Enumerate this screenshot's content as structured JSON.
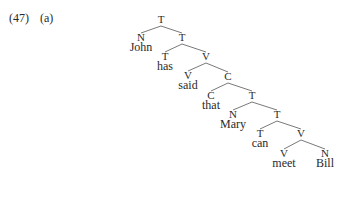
{
  "example": {
    "number": "(47)",
    "sub": "(a)"
  },
  "tree": {
    "nodes": [
      {
        "id": "n0",
        "label": "T",
        "word": null,
        "x": 161,
        "y": 23,
        "parent": null
      },
      {
        "id": "n1",
        "label": "N",
        "word": "John",
        "x": 141,
        "y": 41,
        "parent": "n0"
      },
      {
        "id": "n2",
        "label": "T",
        "word": null,
        "x": 182,
        "y": 41,
        "parent": "n0"
      },
      {
        "id": "n3",
        "label": "T",
        "word": "has",
        "x": 165,
        "y": 60,
        "parent": "n2"
      },
      {
        "id": "n4",
        "label": "V",
        "word": null,
        "x": 206,
        "y": 60,
        "parent": "n2"
      },
      {
        "id": "n5",
        "label": "V",
        "word": "said",
        "x": 188,
        "y": 79,
        "parent": "n4"
      },
      {
        "id": "n6",
        "label": "C",
        "word": null,
        "x": 228,
        "y": 80,
        "parent": "n4"
      },
      {
        "id": "n7",
        "label": "C",
        "word": "that",
        "x": 211,
        "y": 99,
        "parent": "n6"
      },
      {
        "id": "n8",
        "label": "T",
        "word": null,
        "x": 252,
        "y": 99,
        "parent": "n6"
      },
      {
        "id": "n9",
        "label": "N",
        "word": "Mary",
        "x": 233,
        "y": 118,
        "parent": "n8"
      },
      {
        "id": "n10",
        "label": "T",
        "word": null,
        "x": 277,
        "y": 118,
        "parent": "n8"
      },
      {
        "id": "n11",
        "label": "T",
        "word": "can",
        "x": 260,
        "y": 137,
        "parent": "n10"
      },
      {
        "id": "n12",
        "label": "V",
        "word": null,
        "x": 301,
        "y": 137,
        "parent": "n10"
      },
      {
        "id": "n13",
        "label": "V",
        "word": "meet",
        "x": 284,
        "y": 157,
        "parent": "n12"
      },
      {
        "id": "n14",
        "label": "N",
        "word": "Bill",
        "x": 325,
        "y": 157,
        "parent": "n12"
      }
    ],
    "sentence": "John has said that Mary can meet Bill"
  }
}
